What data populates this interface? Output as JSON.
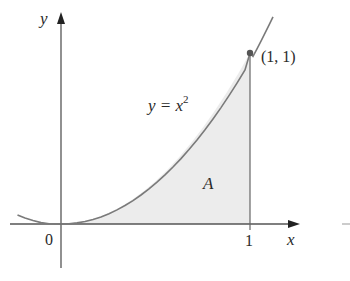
{
  "figure": {
    "axes": {
      "x_label": "x",
      "y_label": "y",
      "origin_label": "0",
      "x_tick_label": "1"
    },
    "curve": {
      "equation_lhs": "y = x",
      "equation_exp": "2",
      "function": "x^2",
      "domain": [
        -0.23,
        1.12
      ]
    },
    "point": {
      "label": "(1, 1)",
      "x": 1,
      "y": 1
    },
    "region": {
      "label": "A",
      "description": "area under y = x^2 from 0 to 1"
    },
    "colors": {
      "axis": "#555555",
      "curve": "#7a7a7a",
      "fill": "#ececec",
      "point": "#555555",
      "text": "#2a2a2a"
    }
  }
}
